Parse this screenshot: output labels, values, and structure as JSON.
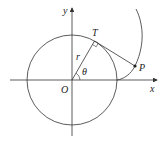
{
  "diagram": {
    "labels": {
      "y_axis": "y",
      "x_axis": "x",
      "origin": "O",
      "tangent_point": "T",
      "point": "P",
      "radius": "r",
      "angle": "θ"
    },
    "colors": {
      "stroke": "#333333",
      "background": "#ffffff"
    }
  }
}
